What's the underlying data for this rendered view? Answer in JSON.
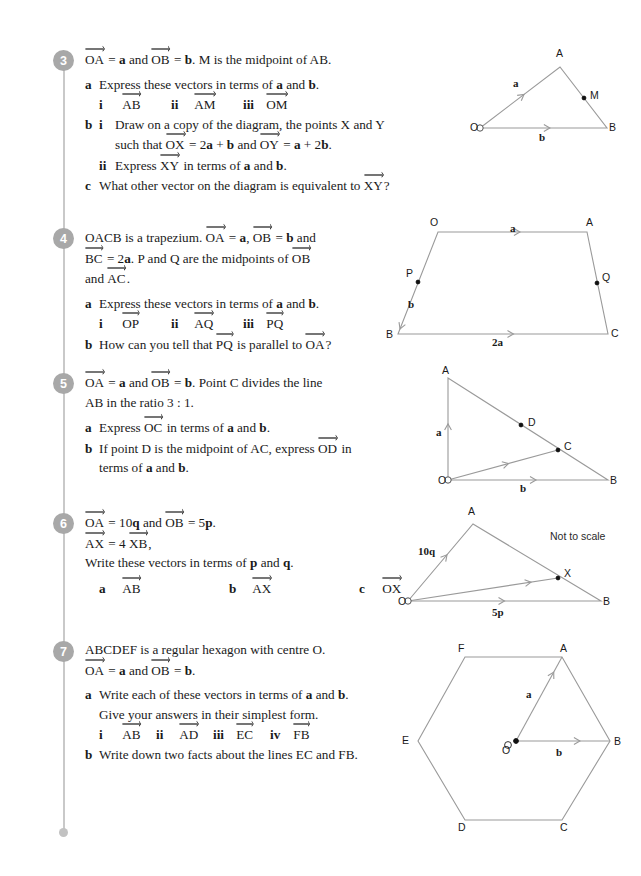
{
  "page": {
    "rail_color": "#c9c9c9",
    "number_badge_color": "#a8a8a8",
    "diagram_stroke": "#9a9a9a"
  },
  "questions": [
    {
      "number": "3",
      "lines": [
        {
          "parts": [
            {
              "vec": "OA"
            },
            {
              "t": " = "
            },
            {
              "b": "a"
            },
            {
              "t": " and "
            },
            {
              "vec": "OB"
            },
            {
              "t": " = "
            },
            {
              "b": "b"
            },
            {
              "t": ". M is the midpoint of AB."
            }
          ]
        }
      ],
      "parts": [
        {
          "label": "a",
          "lines": [
            {
              "parts": [
                {
                  "t": "Express these vectors in terms of "
                },
                {
                  "b": "a"
                },
                {
                  "t": " and "
                },
                {
                  "b": "b"
                },
                {
                  "t": "."
                }
              ]
            }
          ]
        },
        {
          "label": "",
          "romans": [
            "i",
            "ii",
            "iii"
          ],
          "vectors": [
            "AB",
            "AM",
            "OM"
          ]
        },
        {
          "label": "b",
          "sub": "i",
          "lines": [
            {
              "parts": [
                {
                  "t": "Draw on a copy of the diagram, the points X and Y"
                }
              ]
            },
            {
              "parts": [
                {
                  "t": "such that "
                },
                {
                  "vec": "OX"
                },
                {
                  "t": " = 2"
                },
                {
                  "b": "a"
                },
                {
                  "t": " + "
                },
                {
                  "b": "b"
                },
                {
                  "t": " and "
                },
                {
                  "vec": "OY"
                },
                {
                  "t": " = "
                },
                {
                  "b": "a"
                },
                {
                  "t": " + 2"
                },
                {
                  "b": "b"
                },
                {
                  "t": "."
                }
              ]
            }
          ]
        },
        {
          "label": "",
          "sub": "ii",
          "lines": [
            {
              "parts": [
                {
                  "t": "Express "
                },
                {
                  "vec": "XY"
                },
                {
                  "t": " in terms of "
                },
                {
                  "b": "a"
                },
                {
                  "t": " and "
                },
                {
                  "b": "b"
                },
                {
                  "t": "."
                }
              ]
            }
          ]
        },
        {
          "label": "c",
          "lines": [
            {
              "parts": [
                {
                  "t": "What other vector on the diagram is equivalent to "
                },
                {
                  "vec": "XY"
                },
                {
                  "t": "?"
                }
              ]
            }
          ]
        }
      ]
    },
    {
      "number": "4",
      "lines": [
        {
          "parts": [
            {
              "t": "OACB is a trapezium. "
            },
            {
              "vec": "OA"
            },
            {
              "t": " = "
            },
            {
              "b": "a"
            },
            {
              "t": ",  "
            },
            {
              "vec": "OB"
            },
            {
              "t": " = "
            },
            {
              "b": "b"
            },
            {
              "t": " and"
            }
          ]
        },
        {
          "parts": [
            {
              "vec": "BC"
            },
            {
              "t": " = 2"
            },
            {
              "b": "a"
            },
            {
              "t": ". P and Q are the midpoints of "
            },
            {
              "vec": "OB"
            }
          ]
        },
        {
          "parts": [
            {
              "t": "and "
            },
            {
              "vec": "AC"
            },
            {
              "t": "."
            }
          ]
        }
      ],
      "parts": [
        {
          "label": "a",
          "lines": [
            {
              "parts": [
                {
                  "t": "Express these vectors in terms of "
                },
                {
                  "b": "a"
                },
                {
                  "t": " and "
                },
                {
                  "b": "b"
                },
                {
                  "t": "."
                }
              ]
            }
          ]
        },
        {
          "label": "",
          "romans": [
            "i",
            "ii",
            "iii"
          ],
          "vectors": [
            "OP",
            "AQ",
            "PQ"
          ]
        },
        {
          "label": "b",
          "lines": [
            {
              "parts": [
                {
                  "t": "How can you tell that "
                },
                {
                  "vec": "PQ"
                },
                {
                  "t": " is parallel to "
                },
                {
                  "vec": "OA"
                },
                {
                  "t": "?"
                }
              ]
            }
          ]
        }
      ]
    },
    {
      "number": "5",
      "lines": [
        {
          "parts": [
            {
              "vec": "OA"
            },
            {
              "t": " = "
            },
            {
              "b": "a"
            },
            {
              "t": " and "
            },
            {
              "vec": "OB"
            },
            {
              "t": " = "
            },
            {
              "b": "b"
            },
            {
              "t": ". Point C divides the line"
            }
          ]
        },
        {
          "parts": [
            {
              "t": "AB in the ratio 3 : 1."
            }
          ]
        }
      ],
      "parts": [
        {
          "label": "a",
          "lines": [
            {
              "parts": [
                {
                  "t": "Express "
                },
                {
                  "vec": "OC"
                },
                {
                  "t": " in terms of "
                },
                {
                  "b": "a"
                },
                {
                  "t": " and "
                },
                {
                  "b": "b"
                },
                {
                  "t": "."
                }
              ]
            }
          ]
        },
        {
          "label": "b",
          "lines": [
            {
              "parts": [
                {
                  "t": "If point D is the midpoint of AC, express "
                },
                {
                  "vec": "OD"
                },
                {
                  "t": " in"
                }
              ]
            },
            {
              "parts": [
                {
                  "t": "terms of "
                },
                {
                  "b": "a"
                },
                {
                  "t": " and "
                },
                {
                  "b": "b"
                },
                {
                  "t": "."
                }
              ]
            }
          ]
        }
      ]
    },
    {
      "number": "6",
      "lines": [
        {
          "parts": [
            {
              "vec": "OA"
            },
            {
              "t": " = 10"
            },
            {
              "b": "q"
            },
            {
              "t": " and "
            },
            {
              "vec": "OB"
            },
            {
              "t": " = 5"
            },
            {
              "b": "p"
            },
            {
              "t": "."
            }
          ]
        },
        {
          "parts": [
            {
              "vec": "AX"
            },
            {
              "t": " = 4 "
            },
            {
              "vec": "XB"
            },
            {
              "t": ","
            }
          ]
        },
        {
          "parts": [
            {
              "t": "Write these vectors in terms of "
            },
            {
              "b": "p"
            },
            {
              "t": " and "
            },
            {
              "b": "q"
            },
            {
              "t": "."
            }
          ]
        }
      ],
      "parts": [
        {
          "label": "",
          "romans": [
            "a",
            "b",
            "c"
          ],
          "vectors": [
            "AB",
            "AX",
            "OX"
          ]
        }
      ]
    },
    {
      "number": "7",
      "lines": [
        {
          "parts": [
            {
              "t": "ABCDEF is a regular hexagon with centre O."
            }
          ]
        },
        {
          "parts": [
            {
              "vec": "OA"
            },
            {
              "t": " = "
            },
            {
              "b": "a"
            },
            {
              "t": " and "
            },
            {
              "vec": "OB"
            },
            {
              "t": " = "
            },
            {
              "b": "b"
            },
            {
              "t": "."
            }
          ]
        }
      ],
      "parts": [
        {
          "label": "a",
          "lines": [
            {
              "parts": [
                {
                  "t": "Write each of these vectors in terms of "
                },
                {
                  "b": "a"
                },
                {
                  "t": " and "
                },
                {
                  "b": "b"
                },
                {
                  "t": "."
                }
              ]
            },
            {
              "parts": [
                {
                  "t": "Give your answers in their simplest form."
                }
              ]
            }
          ]
        },
        {
          "label": "",
          "romans": [
            "i",
            "ii",
            "iii",
            "iv"
          ],
          "vectors": [
            "AB",
            "AD",
            "EC",
            "FB"
          ]
        },
        {
          "label": "b",
          "lines": [
            {
              "parts": [
                {
                  "t": "Write down two facts about the lines EC and FB."
                }
              ]
            }
          ]
        }
      ]
    }
  ],
  "figures": {
    "q3": {
      "vertices": {
        "O": [
          10,
          83
        ],
        "A": [
          90,
          22
        ],
        "B": [
          137,
          83
        ],
        "M": [
          114,
          53
        ]
      },
      "labels": [
        {
          "text": "O",
          "x": 0,
          "y": 76,
          "bold": false
        },
        {
          "text": "A",
          "x": 86,
          "y": 2,
          "bold": false
        },
        {
          "text": "B",
          "x": 139,
          "y": 76,
          "bold": false
        },
        {
          "text": "M",
          "x": 120,
          "y": 44,
          "bold": false
        },
        {
          "text": "a",
          "x": 43,
          "y": 32,
          "bold": true
        },
        {
          "text": "b",
          "x": 69,
          "y": 86,
          "bold": true
        }
      ]
    },
    "q4": {
      "vertices": {
        "O": [
          48,
          12
        ],
        "A": [
          197,
          12
        ],
        "B": [
          8,
          114
        ],
        "C": [
          218,
          114
        ],
        "P": [
          28,
          62
        ],
        "Q": [
          207,
          63
        ]
      },
      "labels": [
        {
          "text": "O",
          "x": 40,
          "y": -4,
          "bold": false
        },
        {
          "text": "A",
          "x": 196,
          "y": -4,
          "bold": false
        },
        {
          "text": "B",
          "x": -4,
          "y": 108,
          "bold": false
        },
        {
          "text": "C",
          "x": 221,
          "y": 107,
          "bold": false
        },
        {
          "text": "P",
          "x": 16,
          "y": 47,
          "bold": false
        },
        {
          "text": "Q",
          "x": 212,
          "y": 51,
          "bold": false
        },
        {
          "text": "b",
          "x": 18,
          "y": 78,
          "bold": true
        },
        {
          "text": "a",
          "x": 120,
          "y": 2,
          "bold": true
        },
        {
          "text": "2a",
          "x": 102,
          "y": 116,
          "bold": true
        }
      ]
    },
    "q5": {
      "vertices": {
        "A": [
          8,
          8
        ],
        "O": [
          8,
          110
        ],
        "B": [
          168,
          110
        ],
        "C": [
          118,
          80
        ],
        "D": [
          81,
          55
        ]
      },
      "labels": [
        {
          "text": "A",
          "x": 2,
          "y": -6,
          "bold": false
        },
        {
          "text": "O",
          "x": -2,
          "y": 104,
          "bold": false
        },
        {
          "text": "B",
          "x": 170,
          "y": 104,
          "bold": false
        },
        {
          "text": "C",
          "x": 124,
          "y": 70,
          "bold": false
        },
        {
          "text": "D",
          "x": 88,
          "y": 46,
          "bold": false
        },
        {
          "text": "a",
          "x": -4,
          "y": 56,
          "bold": true
        },
        {
          "text": "b",
          "x": 80,
          "y": 112,
          "bold": true
        }
      ]
    },
    "q6": {
      "vertices": {
        "O": [
          10,
          96
        ],
        "A": [
          75,
          19
        ],
        "B": [
          203,
          96
        ],
        "X": [
          160,
          73
        ]
      },
      "labels": [
        {
          "text": "A",
          "x": 70,
          "y": 0,
          "bold": false
        },
        {
          "text": "O",
          "x": 0,
          "y": 90,
          "bold": false
        },
        {
          "text": "B",
          "x": 205,
          "y": 90,
          "bold": false
        },
        {
          "text": "X",
          "x": 166,
          "y": 62,
          "bold": false
        },
        {
          "text": "10q",
          "x": 20,
          "y": 40,
          "bold": true
        },
        {
          "text": "5p",
          "x": 94,
          "y": 101,
          "bold": true
        }
      ],
      "note": "Not to scale",
      "note_pos": [
        152,
        25
      ]
    },
    "q7": {
      "vertices": {
        "F": [
          47,
          27
        ],
        "A": [
          144,
          27
        ],
        "B": [
          192,
          111
        ],
        "C": [
          144,
          190
        ],
        "D": [
          47,
          190
        ],
        "E": [
          0,
          111
        ],
        "O": [
          98,
          111
        ]
      },
      "labels": [
        {
          "text": "F",
          "x": 40,
          "y": 12,
          "bold": false
        },
        {
          "text": "A",
          "x": 142,
          "y": 12,
          "bold": false
        },
        {
          "text": "B",
          "x": 196,
          "y": 105,
          "bold": false
        },
        {
          "text": "C",
          "x": 142,
          "y": 191,
          "bold": false
        },
        {
          "text": "D",
          "x": 40,
          "y": 191,
          "bold": false
        },
        {
          "text": "E",
          "x": -16,
          "y": 104,
          "bold": false
        },
        {
          "text": "O",
          "x": 84,
          "y": 114,
          "bold": false
        },
        {
          "text": "a",
          "x": 108,
          "y": 58,
          "bold": true
        },
        {
          "text": "b",
          "x": 138,
          "y": 116,
          "bold": true
        }
      ]
    }
  }
}
